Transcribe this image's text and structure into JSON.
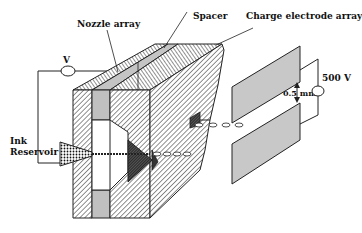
{
  "diagram": {
    "type": "schematic",
    "labels": {
      "nozzle_array": "Nozzle array",
      "spacer": "Spacer",
      "charge_electrode_array": "Charge electrode array",
      "voltage_source": "V",
      "deflection_voltage": "500 V",
      "plate_gap": "0.5 mm",
      "ink_reservoir_line1": "Ink",
      "ink_reservoir_line2": "Reservoir"
    },
    "components": [
      {
        "id": "nozzle-array",
        "label": "Nozzle array"
      },
      {
        "id": "spacer",
        "label": "Spacer"
      },
      {
        "id": "charge-electrode-array",
        "label": "Charge electrode array"
      },
      {
        "id": "voltage-source",
        "label": "V"
      },
      {
        "id": "deflection-plates",
        "label": "500 V",
        "gap": "0.5 mm"
      },
      {
        "id": "ink-reservoir",
        "label": "Ink Reservoir"
      }
    ],
    "colors": {
      "stroke": "#1a1a1a",
      "plate_fill": "#c8c8c8",
      "spacer_fill": "#c0c0c0",
      "background": "#ffffff"
    }
  }
}
